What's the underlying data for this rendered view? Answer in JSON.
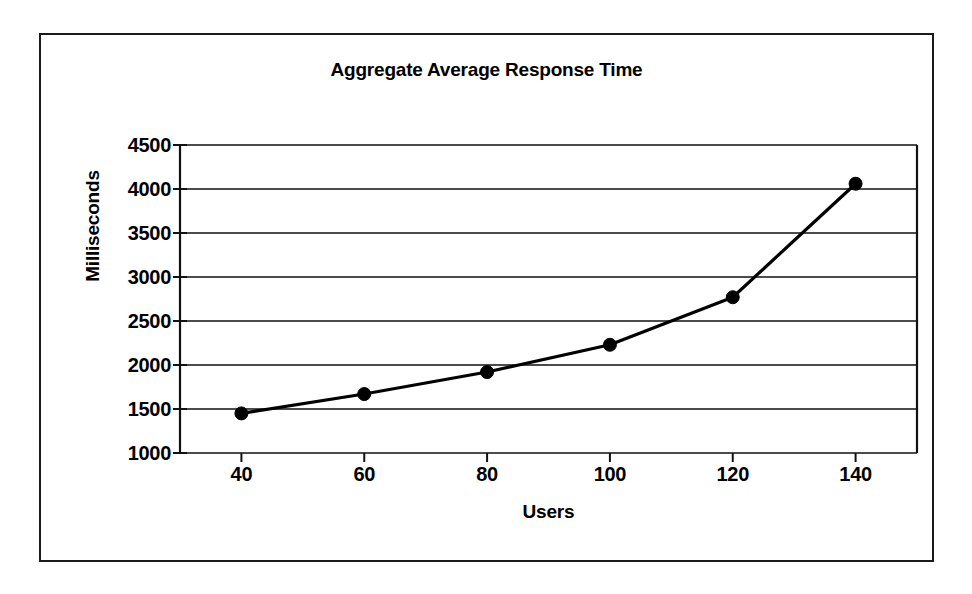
{
  "figure": {
    "background": "#ffffff",
    "border_color": "#1a1a1a",
    "title": "Aggregate Average Response Time"
  },
  "chart_data": {
    "type": "line",
    "title": "Aggregate Average Response Time",
    "xlabel": "Users",
    "ylabel": "Milliseconds",
    "x": [
      40,
      60,
      80,
      100,
      120,
      140
    ],
    "categories": [
      "40",
      "60",
      "80",
      "100",
      "120",
      "140"
    ],
    "values": [
      1450,
      1670,
      1920,
      2230,
      2770,
      4060
    ],
    "series": [
      {
        "name": "Aggregate Average Response Time",
        "values": [
          1450,
          1670,
          1920,
          2230,
          2770,
          4060
        ]
      }
    ],
    "xlim": [
      30,
      150
    ],
    "ylim": [
      1000,
      4500
    ],
    "y_ticks": [
      1000,
      1500,
      2000,
      2500,
      3000,
      3500,
      4000,
      4500
    ],
    "y_tick_labels": [
      "1000",
      "1500",
      "2000",
      "2500",
      "3000",
      "3500",
      "4000",
      "4500"
    ],
    "x_ticks": [
      40,
      60,
      80,
      100,
      120,
      140
    ],
    "x_tick_labels": [
      "40",
      "60",
      "80",
      "100",
      "120",
      "140"
    ],
    "grid": "horizontal",
    "legend": "none",
    "line_color": "#000000",
    "marker": "filled-circle",
    "marker_color": "#000000"
  },
  "axes": {
    "y_title": "Milliseconds",
    "x_title": "Users"
  }
}
